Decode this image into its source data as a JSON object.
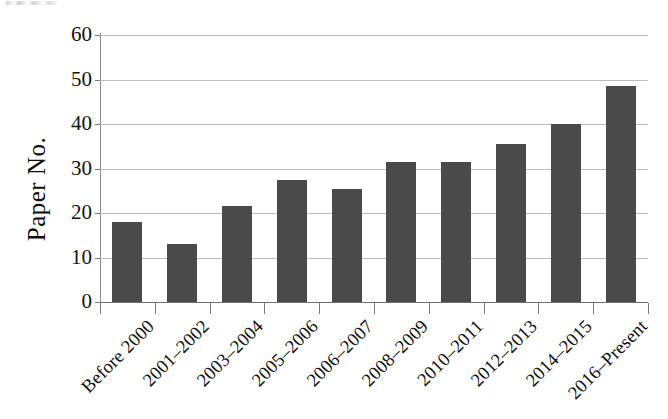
{
  "chart_data": {
    "type": "bar",
    "title": "",
    "xlabel": "",
    "ylabel": "Paper No.",
    "ylim": [
      0,
      60
    ],
    "ytick_step": 10,
    "yticks": [
      "60",
      "50",
      "40",
      "30",
      "20",
      "10",
      "0"
    ],
    "grid": "horizontal",
    "legend": "none",
    "bar_color": "#4a4a4a",
    "categories": [
      "Before 2000",
      "2001–2002",
      "2003–2004",
      "2005–2006",
      "2006–2007",
      "2008–2009",
      "2010–2011",
      "2012–2013",
      "2014–2015",
      "2016–Present"
    ],
    "values": [
      18,
      13,
      21.5,
      27.5,
      25.5,
      31.5,
      31.5,
      35.5,
      40,
      48.5
    ]
  },
  "axes": {
    "y_title": "Paper No."
  }
}
